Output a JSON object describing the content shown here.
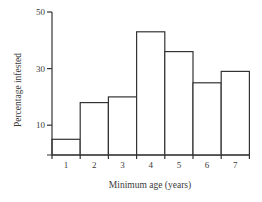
{
  "chart_data": {
    "type": "bar",
    "title": "",
    "xlabel": "Minimum age (years)",
    "ylabel": "Percentage infested",
    "categories": [
      "1",
      "2",
      "3",
      "4",
      "5",
      "6",
      "7"
    ],
    "values": [
      5,
      18,
      20,
      43,
      36,
      25,
      29
    ],
    "ylim": [
      0,
      50
    ],
    "yticks": [
      10,
      30,
      50
    ],
    "grid": false,
    "legend": null,
    "style": "histogram (adjacent bars, outlined)"
  },
  "labels": {
    "ylabel": "Percentage infested",
    "xlabel": "Minimum age (years)",
    "yticks": [
      "10",
      "30",
      "50"
    ],
    "xticks": [
      "1",
      "2",
      "3",
      "4",
      "5",
      "6",
      "7"
    ]
  }
}
